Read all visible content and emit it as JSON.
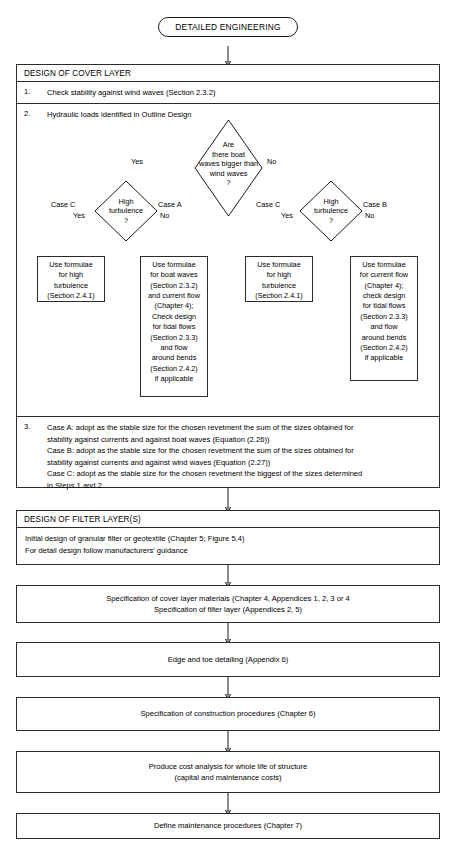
{
  "start": {
    "label": "DETAILED ENGINEERING"
  },
  "cover_layer": {
    "title": "DESIGN OF COVER LAYER",
    "step1_num": "1.",
    "step1_text": "Check stability against wind waves (Section 2.3.2)",
    "step2_num": "2.",
    "step2_text": "Hydraulic loads identified in Outline Design",
    "step3_num": "3.",
    "step3_lines": "Case A: adopt as the stable size for the chosen revetment the sum of the sizes obtained for\n        stability against currents and against boat waves (Equation (2.26))\nCase B: adopt as the stable size for the chosen revetment the sum of the sizes obtained for\n        stability against currents and against wind waves (Equation (2.27))\nCase C: adopt as the stable size for the chosen revetment the biggest of the sizes determined\n        in Steps 1 and 2"
  },
  "decisions": {
    "main": {
      "text": "Are\nthere boat\nwaves bigger than\nwind waves\n?",
      "yes_label": "Yes",
      "no_label": "No"
    },
    "left_turbulence": {
      "text": "High\nturbulence\n?",
      "yes_label": "Yes",
      "no_label": "No",
      "case_yes": "Case C",
      "case_no": "Case A"
    },
    "right_turbulence": {
      "text": "High\nturbulence\n?",
      "yes_label": "Yes",
      "no_label": "No",
      "case_yes": "Case C",
      "case_no": "Case B"
    }
  },
  "formula_boxes": [
    {
      "id": "left-high-turbulence",
      "text": "Use formulae\nfor high\nturbulence\n(Section 2.4.1)"
    },
    {
      "id": "boat-waves-current-flow",
      "text": "Use formulae\nfor boat waves\n(Section 2.3.2)\nand current flow\n(Chapter 4);\nCheck design\nfor tidal flows\n(Section 2.3.3)\nand flow\naround bends\n(Section 2.4.2)\nif applicable"
    },
    {
      "id": "right-high-turbulence",
      "text": "Use formulae\nfor high\nturbulence\n(Section 2.4.1)"
    },
    {
      "id": "current-flow",
      "text": "Use formulae\nfor current flow\n(Chapter 4);\ncheck design\nfor tidal flows\n(Section 2.3.3)\nand flow\naround bends\n(Section 2.4.2)\nif applicable"
    }
  ],
  "filter_layer": {
    "title": "DESIGN OF FILTER LAYER(S)",
    "body": "Initial design of granular filter or geotextile (Chapter 5; Figure 5.4)\nFor detail design follow manufacturers' guidance"
  },
  "steps": [
    {
      "id": "specification-materials",
      "text": "Specification of cover layer materials (Chapter 4, Appendices 1, 2, 3 or 4\nSpecification of filter layer (Appendices 2, 5)"
    },
    {
      "id": "edge-toe-detailing",
      "text": "Edge and toe detailing (Appendix 6)"
    },
    {
      "id": "construction-procedures",
      "text": "Specification of construction procedures (Chapter 6)"
    },
    {
      "id": "cost-analysis",
      "text": "Produce cost analysis for whole life of structure\n(capital and maintenance costs)"
    },
    {
      "id": "maintenance-procedures",
      "text": "Define maintenance procedures (Chapter 7)"
    }
  ],
  "colors": {
    "line": "#1a1a1a",
    "background": "#ffffff",
    "text": "#000000"
  }
}
